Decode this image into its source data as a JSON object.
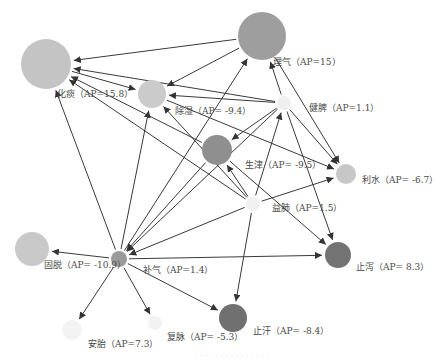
{
  "diagram": {
    "type": "directed-network",
    "nodes": [
      {
        "id": "huatan",
        "label": "化痰（AP=15.8）",
        "x": 46,
        "y": 64,
        "r": 25,
        "color": "#c4c4c4",
        "lx": 57,
        "ly": 94
      },
      {
        "id": "liqi",
        "label": "理气（AP=15）",
        "x": 262,
        "y": 36,
        "r": 24,
        "color": "#9e9e9e",
        "lx": 273,
        "ly": 62
      },
      {
        "id": "chushi",
        "label": "除湿（AP= -9.4）",
        "x": 152,
        "y": 94,
        "r": 14,
        "color": "#cbcbcb",
        "lx": 175,
        "ly": 111
      },
      {
        "id": "jianpi",
        "label": "健脾（AP=1.1）",
        "x": 284,
        "y": 103,
        "r": 7,
        "color": "#f0f0f0",
        "lx": 309,
        "ly": 108
      },
      {
        "id": "shengjin",
        "label": "生津（AP= -9.5）",
        "x": 217,
        "y": 150,
        "r": 15,
        "color": "#8f8f8f",
        "lx": 245,
        "ly": 165
      },
      {
        "id": "lishui",
        "label": "利水（AP= -6.7）",
        "x": 346,
        "y": 174,
        "r": 10,
        "color": "#c7c7c7",
        "lx": 362,
        "ly": 180
      },
      {
        "id": "yifei",
        "label": "益肺（AP=1.5）",
        "x": 253,
        "y": 204,
        "r": 7,
        "color": "#f0f0f0",
        "lx": 272,
        "ly": 208
      },
      {
        "id": "gutuo",
        "label": "固脱（AP= -10.9）",
        "x": 32,
        "y": 249,
        "r": 17,
        "color": "#c9c9c9",
        "lx": 44,
        "ly": 265
      },
      {
        "id": "buqi",
        "label": "补气（AP=1.4）",
        "x": 119,
        "y": 259,
        "r": 8,
        "color": "#9a9a9a",
        "lx": 143,
        "ly": 270
      },
      {
        "id": "zhixie",
        "label": "止泻（AP= 8.3）",
        "x": 338,
        "y": 255,
        "r": 13,
        "color": "#737373",
        "lx": 356,
        "ly": 267
      },
      {
        "id": "anpai",
        "label": "安胎（AP=7.3）",
        "x": 72,
        "y": 330,
        "r": 10,
        "color": "#f3f3f3",
        "lx": 88,
        "ly": 344
      },
      {
        "id": "fumai",
        "label": "复脉（AP= -5.3）",
        "x": 155,
        "y": 323,
        "r": 7,
        "color": "#f2f2f2",
        "lx": 167,
        "ly": 337
      },
      {
        "id": "zhihan",
        "label": "止汗（AP= -8.4）",
        "x": 233,
        "y": 318,
        "r": 14,
        "color": "#707070",
        "lx": 253,
        "ly": 331
      }
    ],
    "edges": [
      {
        "from": "liqi",
        "to": "huatan"
      },
      {
        "from": "liqi",
        "to": "chushi"
      },
      {
        "from": "jianpi",
        "to": "huatan"
      },
      {
        "from": "jianpi",
        "to": "chushi"
      },
      {
        "from": "jianpi",
        "to": "liqi"
      },
      {
        "from": "jianpi",
        "to": "shengjin"
      },
      {
        "from": "jianpi",
        "to": "lishui"
      },
      {
        "from": "jianpi",
        "to": "zhixie"
      },
      {
        "from": "jianpi",
        "to": "buqi"
      },
      {
        "from": "huatan",
        "to": "chushi"
      },
      {
        "from": "chushi",
        "to": "lishui"
      },
      {
        "from": "shengjin",
        "to": "huatan"
      },
      {
        "from": "shengjin",
        "to": "buqi"
      },
      {
        "from": "liqi",
        "to": "lishui"
      },
      {
        "from": "yifei",
        "to": "huatan"
      },
      {
        "from": "yifei",
        "to": "chushi"
      },
      {
        "from": "yifei",
        "to": "shengjin"
      },
      {
        "from": "yifei",
        "to": "jianpi"
      },
      {
        "from": "yifei",
        "to": "lishui"
      },
      {
        "from": "yifei",
        "to": "zhihan"
      },
      {
        "from": "yifei",
        "to": "buqi"
      },
      {
        "from": "shengjin",
        "to": "zhixie"
      },
      {
        "from": "buqi",
        "to": "huatan"
      },
      {
        "from": "buqi",
        "to": "chushi"
      },
      {
        "from": "buqi",
        "to": "liqi"
      },
      {
        "from": "buqi",
        "to": "gutuo"
      },
      {
        "from": "buqi",
        "to": "zhixie"
      },
      {
        "from": "buqi",
        "to": "anpai"
      },
      {
        "from": "buqi",
        "to": "fumai"
      },
      {
        "from": "buqi",
        "to": "zhihan"
      }
    ]
  },
  "footer": {
    "caption": "· · · · · · · · · · · · · · ·"
  },
  "colors": {
    "edge": "#3a3a3a",
    "label": "#4a4a4a"
  }
}
